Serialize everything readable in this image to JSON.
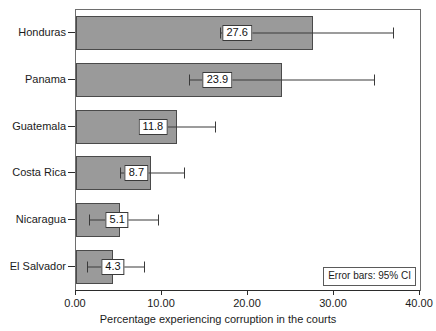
{
  "chart_data": {
    "type": "bar",
    "orientation": "horizontal",
    "title": "",
    "xlabel": "Percentage experiencing corruption in the courts",
    "ylabel": "",
    "categories": [
      "Honduras",
      "Panama",
      "Guatemala",
      "Costa Rica",
      "Nicaragua",
      "El Salvador"
    ],
    "values": [
      27.6,
      23.9,
      11.8,
      8.7,
      5.1,
      4.3
    ],
    "value_labels": [
      "27.6",
      "23.9",
      "11.8",
      "8.7",
      "5.1",
      "4.3"
    ],
    "error_bars": {
      "type": "95% CI",
      "lower": [
        16.7,
        13.1,
        7.5,
        5.1,
        1.5,
        1.3
      ],
      "upper": [
        36.9,
        34.6,
        16.2,
        12.6,
        9.5,
        7.9
      ]
    },
    "xlim": [
      0.0,
      40.0
    ],
    "xticks": [
      0.0,
      10.0,
      20.0,
      30.0,
      40.0
    ],
    "xtick_labels": [
      "0.00",
      "10.00",
      "20.00",
      "30.00",
      "40.00"
    ],
    "grid": false,
    "legend": false,
    "annotation": "Error bars: 95% CI",
    "colors": {
      "bar_fill": "#9a9a9a",
      "bar_border": "#4a4a4a",
      "error_bar": "#3a3a3a",
      "frame": "#6e6e6e",
      "text": "#1b1b1b",
      "background": "#ffffff"
    }
  }
}
